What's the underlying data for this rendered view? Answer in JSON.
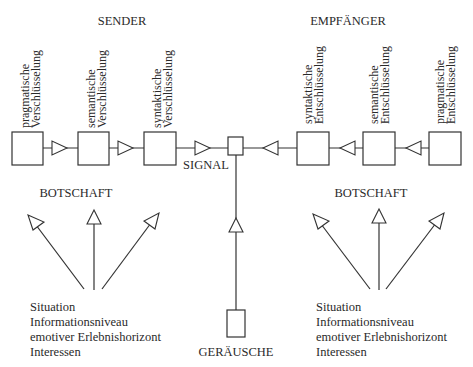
{
  "sender": {
    "title": "SENDER",
    "stages": [
      {
        "line1": "pragmatische",
        "line2": "Verschlüsselung"
      },
      {
        "line1": "semantische",
        "line2": "Verschlüsselung"
      },
      {
        "line1": "syntaktische",
        "line2": "Verschlüsselung"
      }
    ],
    "message_label": "BOTSCHAFT",
    "factors": [
      "Situation",
      "Informationsniveau",
      "emotiver Erlebnishorizont",
      "Interessen"
    ]
  },
  "receiver": {
    "title": "EMPFÄNGER",
    "stages": [
      {
        "line1": "syntaktische",
        "line2": "Entschlüsselung"
      },
      {
        "line1": "semantische",
        "line2": "Entschlüsselung"
      },
      {
        "line1": "pragmatische",
        "line2": "Entschlüsselung"
      }
    ],
    "message_label": "BOTSCHAFT",
    "factors": [
      "Situation",
      "Informationsniveau",
      "emotiver Erlebnishorizont",
      "Interessen"
    ]
  },
  "channel": {
    "signal_label": "SIGNAL",
    "noise_label": "GERÄUSCHE"
  }
}
